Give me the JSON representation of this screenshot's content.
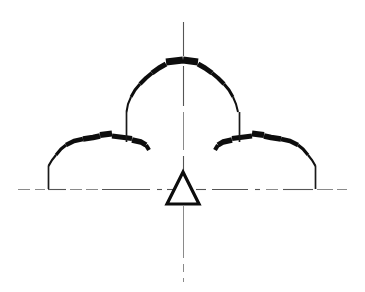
{
  "drawing": {
    "kind": "technical-line-drawing",
    "description": "Symmetric arched structure cross-section: central raised dome flanked by two lower side arches, resting on a horizontal datum line, with a vertical centerline and a triangular support (datum) symbol at the axis.",
    "background_color": "#ffffff",
    "ink_color": "#111111",
    "centerline_color": "#555555",
    "canvas": {
      "width": 365,
      "height": 292
    },
    "elements": {
      "horizontal_datum_line": {
        "name": "horizontal-centerline",
        "y": 189,
        "x_start": 18,
        "x_end": 347,
        "style": "dash-dot"
      },
      "vertical_centerline": {
        "name": "vertical-centerline",
        "x": 183,
        "y_start": 22,
        "y_end": 282,
        "style": "dash-dot"
      },
      "central_dome": {
        "name": "central-dome-arch",
        "apex_y": 59,
        "springing_y": 130,
        "left_leg_x": 126,
        "right_leg_x": 240,
        "stroke_weight_top": 6,
        "stroke_weight_leg": 2
      },
      "left_arch": {
        "name": "left-side-arch",
        "crown_y": 133,
        "base_y": 189,
        "left_leg_x": 48,
        "right_end_x": 145,
        "stroke_weight_top": 5,
        "stroke_weight_leg": 2
      },
      "right_arch": {
        "name": "right-side-arch",
        "crown_y": 133,
        "base_y": 189,
        "right_leg_x": 315,
        "left_end_x": 219,
        "stroke_weight_top": 5,
        "stroke_weight_leg": 2
      },
      "support_symbol": {
        "name": "triangle-support-symbol",
        "shape": "triangle",
        "apex_x": 183,
        "apex_y": 172,
        "base_y": 204,
        "half_width": 16,
        "stroke_weight": 3
      }
    }
  }
}
